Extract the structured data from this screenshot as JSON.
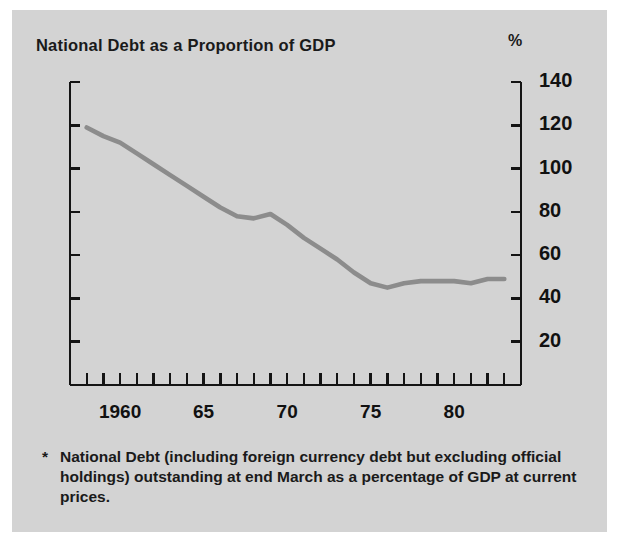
{
  "figure": {
    "background_color": "#d3d3d3",
    "title": "National Debt as a Proportion of GDP",
    "unit_label": "%",
    "footnote_marker": "*",
    "footnote": "National Debt (including foreign currency debt but excluding official holdings) outstanding at end March as a percentage of GDP at current prices."
  },
  "chart_data": {
    "type": "line",
    "title": "National Debt as a Proportion of GDP",
    "xlabel": "",
    "ylabel": "%",
    "ylim": [
      0,
      140
    ],
    "xlim": [
      1957,
      1984
    ],
    "grid": false,
    "legend": null,
    "line_color": "#8c8c8c",
    "y_ticks": [
      20,
      40,
      60,
      80,
      100,
      120,
      140
    ],
    "y_tick_labels": [
      "20",
      "40",
      "60",
      "80",
      "100",
      "120",
      "140"
    ],
    "x_ticks": [
      1957,
      1958,
      1959,
      1960,
      1961,
      1962,
      1963,
      1964,
      1965,
      1966,
      1967,
      1968,
      1969,
      1970,
      1971,
      1972,
      1973,
      1974,
      1975,
      1976,
      1977,
      1978,
      1979,
      1980,
      1981,
      1982,
      1983,
      1984
    ],
    "x_tick_labels": [
      {
        "x": 1960,
        "label": "1960"
      },
      {
        "x": 1965,
        "label": "65"
      },
      {
        "x": 1970,
        "label": "70"
      },
      {
        "x": 1975,
        "label": "75"
      },
      {
        "x": 1980,
        "label": "80"
      }
    ],
    "series": [
      {
        "name": "National Debt as % of GDP",
        "x": [
          1958,
          1959,
          1960,
          1961,
          1962,
          1963,
          1964,
          1965,
          1966,
          1967,
          1968,
          1969,
          1970,
          1971,
          1972,
          1973,
          1974,
          1975,
          1976,
          1977,
          1978,
          1979,
          1980,
          1981,
          1982,
          1983
        ],
        "values": [
          119,
          115,
          112,
          107,
          102,
          97,
          92,
          87,
          82,
          78,
          77,
          79,
          74,
          68,
          63,
          58,
          52,
          47,
          45,
          47,
          48,
          48,
          48,
          47,
          49,
          49
        ]
      }
    ]
  }
}
